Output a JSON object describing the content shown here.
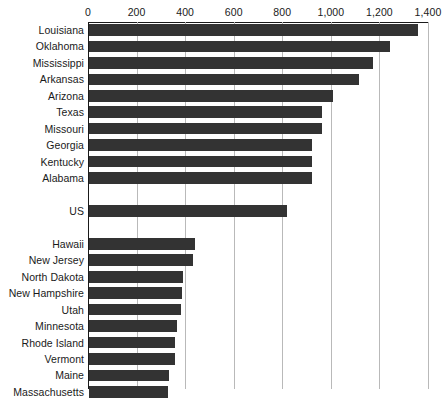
{
  "chart_data": {
    "type": "bar",
    "orientation": "horizontal",
    "title": "",
    "subtitle": "",
    "xlabel": "",
    "ylabel": "",
    "xlim": [
      0,
      1400
    ],
    "ylim": null,
    "grid": "vertical",
    "legend": null,
    "axis_position": "top",
    "bar_color": "#333333",
    "gridline_color": "#b9b9b9",
    "axis_color": "#1a1a1a",
    "background": "#ffffff",
    "tick_labels": [
      "0",
      "200",
      "400",
      "600",
      "800",
      "1,000",
      "1,200",
      "1,400"
    ],
    "ticks": [
      0,
      200,
      400,
      600,
      800,
      1000,
      1200,
      1400
    ],
    "categories": [
      "Louisiana",
      "Oklahoma",
      "Mississippi",
      "Arkansas",
      "Arizona",
      "Texas",
      "Missouri",
      "Georgia",
      "Kentucky",
      "Alabama",
      "",
      "US",
      "",
      "Hawaii",
      "New Jersey",
      "North Dakota",
      "New Hampshire",
      "Utah",
      "Minnesota",
      "Rhode Island",
      "Vermont",
      "Maine",
      "Massachusetts"
    ],
    "values": [
      1355,
      1240,
      1170,
      1110,
      1005,
      960,
      960,
      920,
      920,
      920,
      null,
      815,
      null,
      436,
      428,
      387,
      383,
      378,
      362,
      354,
      354,
      329,
      325
    ],
    "rows": [
      {
        "label": "Louisiana",
        "value": 1355,
        "spacer": false
      },
      {
        "label": "Oklahoma",
        "value": 1240,
        "spacer": false
      },
      {
        "label": "Mississippi",
        "value": 1170,
        "spacer": false
      },
      {
        "label": "Arkansas",
        "value": 1110,
        "spacer": false
      },
      {
        "label": "Arizona",
        "value": 1005,
        "spacer": false
      },
      {
        "label": "Texas",
        "value": 960,
        "spacer": false
      },
      {
        "label": "Missouri",
        "value": 960,
        "spacer": false
      },
      {
        "label": "Georgia",
        "value": 920,
        "spacer": false
      },
      {
        "label": "Kentucky",
        "value": 920,
        "spacer": false
      },
      {
        "label": "Alabama",
        "value": 920,
        "spacer": false
      },
      {
        "label": "",
        "value": null,
        "spacer": true
      },
      {
        "label": "US",
        "value": 815,
        "spacer": false
      },
      {
        "label": "",
        "value": null,
        "spacer": true
      },
      {
        "label": "Hawaii",
        "value": 436,
        "spacer": false
      },
      {
        "label": "New Jersey",
        "value": 428,
        "spacer": false
      },
      {
        "label": "North Dakota",
        "value": 387,
        "spacer": false
      },
      {
        "label": "New Hampshire",
        "value": 383,
        "spacer": false
      },
      {
        "label": "Utah",
        "value": 378,
        "spacer": false
      },
      {
        "label": "Minnesota",
        "value": 362,
        "spacer": false
      },
      {
        "label": "Rhode Island",
        "value": 354,
        "spacer": false
      },
      {
        "label": "Vermont",
        "value": 354,
        "spacer": false
      },
      {
        "label": "Maine",
        "value": 329,
        "spacer": false
      },
      {
        "label": "Massachusetts",
        "value": 325,
        "spacer": false
      }
    ]
  }
}
